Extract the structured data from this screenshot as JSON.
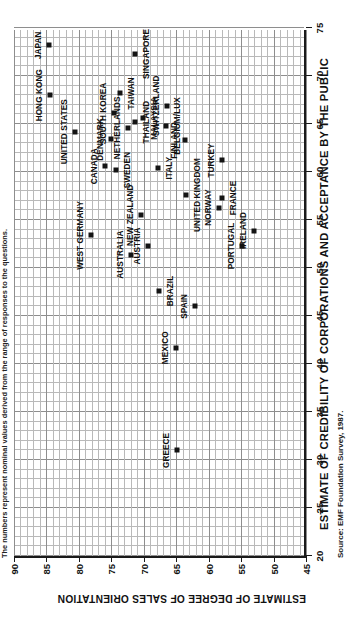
{
  "note": "The numbers represent nominal values derived from the range of responses to the questions.",
  "source": "Source: EMF Foundation Survey, 1987.",
  "chart_data": {
    "type": "scatter",
    "title": "",
    "xlabel": "ESTIMATE OF CREDIBILITY OF CORPORATIONS AND ACCEPTANCE BY THE PUBLIC",
    "ylabel": "ESTIMATE OF DEGREE OF SALES ORIENTATION",
    "xlim": [
      20,
      75
    ],
    "ylim": [
      45,
      90
    ],
    "xticks": [
      20,
      25,
      30,
      35,
      40,
      45,
      50,
      55,
      60,
      65,
      70,
      75
    ],
    "yticks": [
      45,
      50,
      55,
      60,
      65,
      70,
      75,
      80,
      85,
      90
    ],
    "grid": true,
    "minor_grid": true,
    "legend": "none",
    "marker": "filled-square",
    "marker_color": "#141414",
    "points": [
      {
        "label": "JAPAN",
        "x": 73.2,
        "y": 84.6,
        "lab_dx": 0,
        "lab_dy": -11,
        "lab_anchor": "center"
      },
      {
        "label": "HONG KONG",
        "x": 68.0,
        "y": 84.4,
        "lab_dx": 0,
        "lab_dy": -11,
        "lab_anchor": "center"
      },
      {
        "label": "SINGAPORE",
        "x": 72.3,
        "y": 71.3,
        "lab_dx": 0,
        "lab_dy": 11,
        "lab_anchor": "center"
      },
      {
        "label": "UNITED STATES",
        "x": 64.2,
        "y": 80.6,
        "lab_dx": 0,
        "lab_dy": -11,
        "lab_anchor": "center"
      },
      {
        "label": "SOUTH KOREA",
        "x": 66.1,
        "y": 74.6,
        "lab_dx": 0,
        "lab_dy": -11,
        "lab_anchor": "center"
      },
      {
        "label": "TAIWAN",
        "x": 68.2,
        "y": 73.7,
        "lab_dx": 0,
        "lab_dy": 11,
        "lab_anchor": "center"
      },
      {
        "label": "DENMARK",
        "x": 63.4,
        "y": 75.0,
        "lab_dx": 0,
        "lab_dy": -11,
        "lab_anchor": "center"
      },
      {
        "label": "NETHERLANDS",
        "x": 64.6,
        "y": 72.5,
        "lab_dx": 0,
        "lab_dy": -11,
        "lab_anchor": "center"
      },
      {
        "label": "THAILAND",
        "x": 65.2,
        "y": 71.4,
        "lab_dx": 0,
        "lab_dy": 11,
        "lab_anchor": "center"
      },
      {
        "label": "MALAYSIA",
        "x": 65.6,
        "y": 70.1,
        "lab_dx": 0,
        "lab_dy": 11,
        "lab_anchor": "center"
      },
      {
        "label": "SWITZERLAND",
        "x": 66.9,
        "y": 66.4,
        "lab_dx": 0,
        "lab_dy": -11,
        "lab_anchor": "center"
      },
      {
        "label": "BELGIUM/LUX",
        "x": 64.8,
        "y": 66.5,
        "lab_dx": 0,
        "lab_dy": 11,
        "lab_anchor": "center"
      },
      {
        "label": "FINLAND",
        "x": 63.3,
        "y": 63.6,
        "lab_dx": 0,
        "lab_dy": -11,
        "lab_anchor": "center"
      },
      {
        "label": "TURKEY",
        "x": 61.2,
        "y": 58.0,
        "lab_dx": 0,
        "lab_dy": -11,
        "lab_anchor": "center"
      },
      {
        "label": "CANADA",
        "x": 60.6,
        "y": 76.0,
        "lab_dx": 0,
        "lab_dy": -11,
        "lab_anchor": "center"
      },
      {
        "label": "SWEDEN",
        "x": 60.2,
        "y": 74.3,
        "lab_dx": 0,
        "lab_dy": 11,
        "lab_anchor": "center"
      },
      {
        "label": "ITALY",
        "x": 60.4,
        "y": 67.8,
        "lab_dx": 0,
        "lab_dy": 11,
        "lab_anchor": "center"
      },
      {
        "label": "UNITED KINGDOM",
        "x": 57.6,
        "y": 63.5,
        "lab_dx": 0,
        "lab_dy": 11,
        "lab_anchor": "center"
      },
      {
        "label": "FRANCE",
        "x": 57.3,
        "y": 58.0,
        "lab_dx": 0,
        "lab_dy": 11,
        "lab_anchor": "center"
      },
      {
        "label": "NORWAY",
        "x": 56.3,
        "y": 58.4,
        "lab_dx": 0,
        "lab_dy": -11,
        "lab_anchor": "center"
      },
      {
        "label": "WEST GERMANY",
        "x": 53.4,
        "y": 78.1,
        "lab_dx": 0,
        "lab_dy": -11,
        "lab_anchor": "center"
      },
      {
        "label": "NEW ZEALAND",
        "x": 55.5,
        "y": 70.5,
        "lab_dx": 0,
        "lab_dy": -11,
        "lab_anchor": "center"
      },
      {
        "label": "AUSTRALIA",
        "x": 51.4,
        "y": 72.0,
        "lab_dx": 0,
        "lab_dy": -11,
        "lab_anchor": "center"
      },
      {
        "label": "AUSTRIA",
        "x": 52.3,
        "y": 69.3,
        "lab_dx": 0,
        "lab_dy": -11,
        "lab_anchor": "center"
      },
      {
        "label": "PORTUGAL",
        "x": 52.3,
        "y": 54.9,
        "lab_dx": 0,
        "lab_dy": -11,
        "lab_anchor": "center"
      },
      {
        "label": "IRELAND",
        "x": 53.9,
        "y": 53.0,
        "lab_dx": 0,
        "lab_dy": -11,
        "lab_anchor": "center"
      },
      {
        "label": "BRAZIL",
        "x": 47.6,
        "y": 67.6,
        "lab_dx": 0,
        "lab_dy": 11,
        "lab_anchor": "center"
      },
      {
        "label": "SPAIN",
        "x": 46.0,
        "y": 62.1,
        "lab_dx": 0,
        "lab_dy": -11,
        "lab_anchor": "center"
      },
      {
        "label": "MEXICO",
        "x": 41.7,
        "y": 65.0,
        "lab_dx": 0,
        "lab_dy": -11,
        "lab_anchor": "center"
      },
      {
        "label": "GREECE",
        "x": 31.0,
        "y": 64.9,
        "lab_dx": 0,
        "lab_dy": -11,
        "lab_anchor": "center"
      }
    ]
  }
}
